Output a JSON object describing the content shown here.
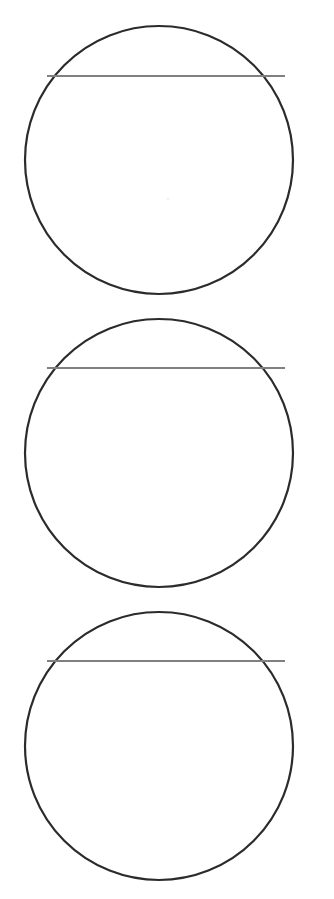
{
  "page": {
    "background_color": "#ffffff",
    "width": 334,
    "height": 899,
    "clipped_header_text": "diagram figure"
  },
  "style": {
    "circle_stroke_color": "#2b2b2b",
    "circle_stroke_width": 2.2,
    "circle_fill_color": "#ffffff",
    "chord_stroke_color": "#808080",
    "chord_stroke_width": 2.0,
    "center_mark_color": "#f2f2f4"
  },
  "figures": [
    {
      "name": "circle-1",
      "label": "",
      "center_x": 159,
      "center_y": 160,
      "radius": 134,
      "chord": {
        "name": "chord-1",
        "label": "",
        "y": 76,
        "x_start": 47,
        "x_end": 285
      },
      "center_mark": {
        "name": "center-mark-1",
        "visible": true,
        "x": 168,
        "y": 199,
        "radius": 1.6
      }
    },
    {
      "name": "circle-2",
      "label": "",
      "center_x": 159,
      "center_y": 453,
      "radius": 134,
      "chord": {
        "name": "chord-2",
        "label": "",
        "y": 368,
        "x_start": 47,
        "x_end": 285
      },
      "center_mark": {
        "name": "center-mark-2",
        "visible": false,
        "x": 168,
        "y": 492,
        "radius": 1.6
      }
    },
    {
      "name": "circle-3",
      "label": "",
      "center_x": 159,
      "center_y": 746,
      "radius": 134,
      "chord": {
        "name": "chord-3",
        "label": "",
        "y": 661,
        "x_start": 47,
        "x_end": 285
      },
      "center_mark": {
        "name": "center-mark-3",
        "visible": false,
        "x": 168,
        "y": 785,
        "radius": 1.6
      }
    }
  ],
  "chart_data": {
    "type": "diagram",
    "title": "",
    "shape_count": 3,
    "shapes": [
      {
        "id": 1,
        "shape": "circle",
        "center": [
          159,
          160
        ],
        "radius": 134,
        "chord_y": 76,
        "chord_x_extent": [
          47,
          285
        ],
        "chord_length": 238,
        "chord_depth_from_top": 0.18
      },
      {
        "id": 2,
        "shape": "circle",
        "center": [
          159,
          453
        ],
        "radius": 134,
        "chord_y": 368,
        "chord_x_extent": [
          47,
          285
        ],
        "chord_length": 238,
        "chord_depth_from_top": 0.18
      },
      {
        "id": 3,
        "shape": "circle",
        "center": [
          159,
          746
        ],
        "radius": 134,
        "chord_y": 661,
        "chord_x_extent": [
          47,
          285
        ],
        "chord_length": 238,
        "chord_depth_from_top": 0.18
      }
    ],
    "xlabel": "",
    "ylabel": "",
    "grid": false,
    "legend": []
  }
}
